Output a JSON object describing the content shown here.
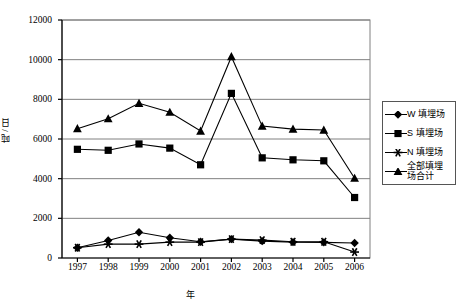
{
  "chart_data": {
    "type": "line",
    "title": "",
    "xlabel": "年",
    "ylabel": "吨 / 日",
    "categories": [
      "1997",
      "1998",
      "1999",
      "2000",
      "2001",
      "2002",
      "2003",
      "2004",
      "2005",
      "2006"
    ],
    "x": [
      1997,
      1998,
      1999,
      2000,
      2001,
      2002,
      2003,
      2004,
      2005,
      2006
    ],
    "xlim": [
      1996.5,
      2006.5
    ],
    "ylim": [
      0,
      12000
    ],
    "ytick_labels": [
      "0",
      "2000",
      "4000",
      "6000",
      "8000",
      "10000",
      "12000"
    ],
    "yticks": [
      0,
      2000,
      4000,
      6000,
      8000,
      10000,
      12000
    ],
    "grid": "horizontal",
    "legend_position": "right",
    "series": [
      {
        "name": "W 填埋场",
        "marker": "diamond",
        "values": [
          520,
          880,
          1300,
          1020,
          820,
          950,
          850,
          800,
          790,
          760
        ]
      },
      {
        "name": "S 填埋场",
        "marker": "square",
        "values": [
          5480,
          5430,
          5750,
          5540,
          4700,
          8300,
          5050,
          4950,
          4900,
          3050
        ]
      },
      {
        "name": "N 填埋场",
        "marker": "star",
        "values": [
          520,
          700,
          700,
          800,
          800,
          950,
          900,
          820,
          820,
          300
        ]
      },
      {
        "name": "全部填埋场合计",
        "marker": "triangle",
        "values": [
          6520,
          7020,
          7800,
          7350,
          6400,
          10150,
          6650,
          6500,
          6450,
          4020
        ]
      }
    ]
  },
  "legend": {
    "items": [
      {
        "label": "W 填埋场",
        "marker": "diamond"
      },
      {
        "label": "S 填埋场",
        "marker": "square"
      },
      {
        "label": "N 填埋场",
        "marker": "star"
      },
      {
        "label": "全部填埋\n场合计",
        "marker": "triangle"
      }
    ]
  },
  "axes": {
    "y_title": "吨 / 日",
    "x_title": "年"
  }
}
